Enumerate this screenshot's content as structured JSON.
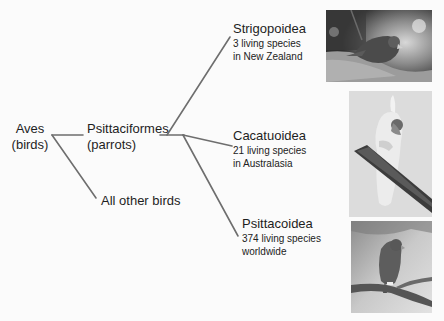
{
  "diagram": {
    "type": "cladogram",
    "root": {
      "name": "Aves",
      "common": "(birds)"
    },
    "branches": [
      {
        "name": "Psittaciformes",
        "common": "(parrots)"
      },
      {
        "name": "All other birds"
      }
    ],
    "parrot_clades": [
      {
        "name": "Strigopoidea",
        "line1": "3 living species",
        "line2": "in New Zealand",
        "photo": "kea-or-kaka-photo"
      },
      {
        "name": "Cacatuoidea",
        "line1": "21 living species",
        "line2": "in Australasia",
        "photo": "cockatoo-photo"
      },
      {
        "name": "Psittacoidea",
        "line1": "374 living species",
        "line2": "worldwide",
        "photo": "parrot-on-branch-photo"
      }
    ],
    "colors": {
      "line": "#6e6e6e",
      "text": "#1e1e1e",
      "background": "#fbfbfb"
    }
  }
}
